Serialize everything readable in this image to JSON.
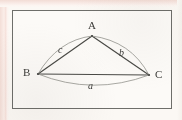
{
  "figure": {
    "background_color": "#fbf8f4",
    "page_edge_color": "#f3ded7",
    "frame_color": "#6e6e6a",
    "ink_color": "#4a4a46",
    "arc_color": "#9a9a94",
    "vertices": [
      {
        "id": "A",
        "label": "A",
        "x": 92,
        "y": 36
      },
      {
        "id": "B",
        "label": "B",
        "x": 38,
        "y": 74
      },
      {
        "id": "C",
        "label": "C",
        "x": 149,
        "y": 75
      }
    ],
    "sides": [
      {
        "id": "a",
        "label": "a",
        "from": "B",
        "to": "C",
        "style": "arc",
        "bulge": "outward-below"
      },
      {
        "id": "b",
        "label": "b",
        "from": "A",
        "to": "C",
        "style": "arc",
        "bulge": "outward-right"
      },
      {
        "id": "c",
        "label": "c",
        "from": "B",
        "to": "A",
        "style": "arc",
        "bulge": "outward-left"
      }
    ],
    "chords": [
      {
        "from": "B",
        "to": "A"
      },
      {
        "from": "A",
        "to": "C"
      },
      {
        "from": "B",
        "to": "C"
      }
    ]
  }
}
